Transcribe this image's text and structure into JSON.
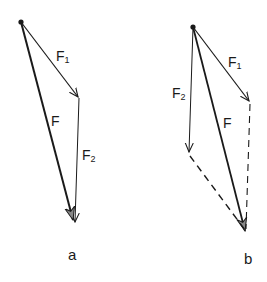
{
  "diagrams": [
    {
      "id": "a",
      "caption": "a",
      "labels": {
        "f1": "F",
        "f1_sub": "1",
        "f": "F",
        "f2": "F",
        "f2_sub": "2"
      },
      "description": "Triangle rule: F1 then F2 tip-to-tail, resultant F"
    },
    {
      "id": "b",
      "caption": "b",
      "labels": {
        "f1": "F",
        "f1_sub": "1",
        "f": "F",
        "f2": "F",
        "f2_sub": "2"
      },
      "description": "Parallelogram rule: F1 and F2 from common point, resultant F along diagonal"
    }
  ],
  "colors": {
    "ink": "#1a1a1a",
    "background": "#ffffff"
  }
}
